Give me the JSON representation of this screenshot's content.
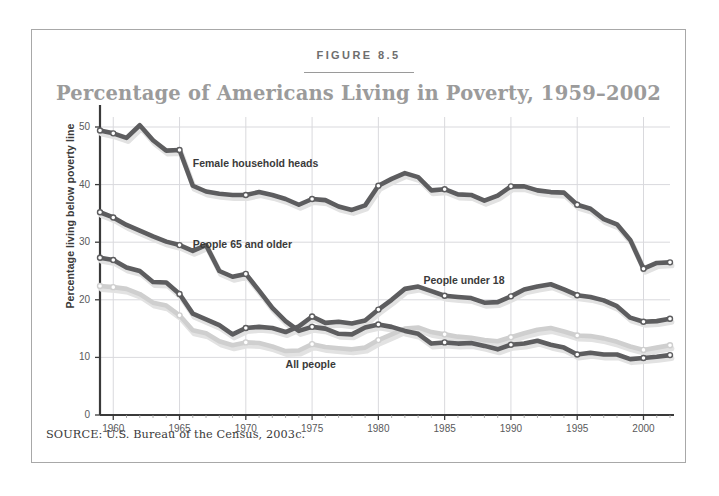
{
  "figure": {
    "number": "FIGURE 8.5",
    "title": "Percentage of Americans Living in Poverty, 1959–2002",
    "source": "SOURCE: U.S. Bureau of the Census, 2003c."
  },
  "colors": {
    "frame_border": "#a8a8a8",
    "title_text": "#9b9b9b",
    "figure_number_text": "#6e6e6e",
    "axis": "#3a3a3a",
    "gridline": "#d9d9dd",
    "dark_line": "#5d5d5f",
    "light_line": "#cfcfcf",
    "shadow": "#e2e2e2",
    "marker_fill": "#ffffff",
    "background": "#ffffff"
  },
  "labels": {
    "female_household_heads": "Female household heads",
    "people_65_and_older": "People 65 and older",
    "people_under_18": "People under 18",
    "all_people": "All people"
  },
  "chart_data": {
    "type": "line",
    "title": "Percentage of Americans Living in Poverty, 1959–2002",
    "xlabel": "",
    "ylabel": "Percentage living below poverty line",
    "xlim": [
      1959,
      2002
    ],
    "ylim": [
      0,
      50
    ],
    "ytick_labels": [
      "0",
      "10",
      "20",
      "30",
      "40",
      "50"
    ],
    "yticks": [
      0,
      10,
      20,
      30,
      40,
      50
    ],
    "xtick_labels": [
      "1960",
      "1965",
      "1970",
      "1975",
      "1980",
      "1985",
      "1990",
      "1995",
      "2000"
    ],
    "xticks": [
      1960,
      1965,
      1970,
      1975,
      1980,
      1985,
      1990,
      1995,
      2000
    ],
    "grid": true,
    "legend_position": "inline-annotations",
    "marker_years": [
      1959,
      1960,
      1965,
      1970,
      1975,
      1980,
      1985,
      1990,
      1995,
      2000,
      2002
    ],
    "x": [
      1959,
      1960,
      1961,
      1962,
      1963,
      1964,
      1965,
      1966,
      1967,
      1968,
      1969,
      1970,
      1971,
      1972,
      1973,
      1974,
      1975,
      1976,
      1977,
      1978,
      1979,
      1980,
      1981,
      1982,
      1983,
      1984,
      1985,
      1986,
      1987,
      1988,
      1989,
      1990,
      1991,
      1992,
      1993,
      1994,
      1995,
      1996,
      1997,
      1998,
      1999,
      2000,
      2001,
      2002
    ],
    "series": [
      {
        "name": "Female household heads",
        "color": "#5d5d5f",
        "values": [
          49.4,
          48.9,
          48.1,
          50.3,
          47.7,
          45.9,
          46.0,
          39.8,
          38.8,
          38.4,
          38.2,
          38.2,
          38.7,
          38.2,
          37.5,
          36.5,
          37.5,
          37.3,
          36.2,
          35.6,
          36.4,
          39.8,
          41.0,
          42.0,
          41.3,
          39.0,
          39.2,
          38.3,
          38.2,
          37.2,
          38.1,
          39.7,
          39.7,
          39.0,
          38.7,
          38.6,
          36.5,
          35.8,
          34.0,
          33.1,
          30.4,
          25.4,
          26.4,
          26.5
        ]
      },
      {
        "name": "People 65 and older",
        "color": "#5d5d5f",
        "values": [
          35.2,
          34.3,
          33.0,
          32.0,
          31.0,
          30.1,
          29.5,
          28.5,
          29.5,
          25.0,
          24.0,
          24.5,
          21.6,
          18.6,
          16.3,
          14.6,
          15.3,
          15.0,
          14.1,
          14.0,
          15.2,
          15.7,
          15.3,
          14.6,
          14.1,
          12.4,
          12.6,
          12.4,
          12.5,
          12.0,
          11.4,
          12.2,
          12.4,
          12.9,
          12.2,
          11.7,
          10.5,
          10.8,
          10.5,
          10.5,
          9.7,
          9.9,
          10.1,
          10.4
        ]
      },
      {
        "name": "People under 18",
        "color": "#5d5d5f",
        "values": [
          27.3,
          26.9,
          25.6,
          25.0,
          23.1,
          23.0,
          21.0,
          17.6,
          16.6,
          15.6,
          14.0,
          15.1,
          15.3,
          15.1,
          14.4,
          15.4,
          17.1,
          16.0,
          16.2,
          15.9,
          16.4,
          18.3,
          20.0,
          21.9,
          22.3,
          21.5,
          20.7,
          20.5,
          20.3,
          19.5,
          19.6,
          20.6,
          21.8,
          22.3,
          22.7,
          21.8,
          20.8,
          20.5,
          19.9,
          18.9,
          16.9,
          16.2,
          16.3,
          16.7
        ]
      },
      {
        "name": "All people",
        "color": "#cfcfcf",
        "values": [
          22.4,
          22.2,
          21.9,
          21.0,
          19.5,
          19.0,
          17.3,
          14.7,
          14.2,
          12.8,
          12.1,
          12.6,
          12.5,
          11.9,
          11.1,
          11.2,
          12.3,
          11.8,
          11.6,
          11.4,
          11.7,
          13.0,
          14.0,
          15.0,
          15.2,
          14.4,
          14.0,
          13.6,
          13.4,
          13.0,
          12.8,
          13.5,
          14.2,
          14.8,
          15.1,
          14.5,
          13.8,
          13.7,
          13.3,
          12.7,
          11.9,
          11.3,
          11.7,
          12.1
        ]
      }
    ],
    "annotations": [
      {
        "text": "Female household heads",
        "x": 1966.0,
        "y": 43.5
      },
      {
        "text": "People 65 and older",
        "x": 1966.0,
        "y": 29.5
      },
      {
        "text": "People under 18",
        "x": 1983.4,
        "y": 23.2
      },
      {
        "text": "All people",
        "x": 1973.0,
        "y": 8.6
      }
    ]
  }
}
